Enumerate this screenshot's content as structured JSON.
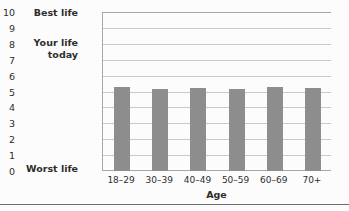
{
  "chart_data": {
    "type": "bar",
    "title": "",
    "subtitle": "",
    "xlabel": "Age",
    "ylabel": "Your life today",
    "categories": [
      "18–29",
      "30–39",
      "40–49",
      "50–59",
      "60–69",
      "70+"
    ],
    "values": [
      5.3,
      5.15,
      5.25,
      5.15,
      5.3,
      5.2
    ],
    "series": [
      {
        "name": "Your life today",
        "values": [
          5.3,
          5.15,
          5.25,
          5.15,
          5.3,
          5.2
        ]
      }
    ],
    "ylim": [
      0,
      10
    ],
    "ytick_labels": [
      "0",
      "1",
      "2",
      "3",
      "4",
      "5",
      "6",
      "7",
      "8",
      "9",
      "10"
    ],
    "ytick_values": [
      0,
      1,
      2,
      3,
      4,
      5,
      6,
      7,
      8,
      9,
      10
    ],
    "y_axis_end_labels": {
      "top": "Best life",
      "bottom": "Worst life",
      "middle": "Your life\ntoday"
    },
    "grid": true,
    "grid_axis": "y",
    "legend": null,
    "legend_position": "none",
    "bar_color": "#8d8d8d",
    "grid_color": "#c9c9c9",
    "axis_color": "#a8a8a8",
    "background_color": "#fcfcfc",
    "text_color": "#2e2e2e"
  }
}
